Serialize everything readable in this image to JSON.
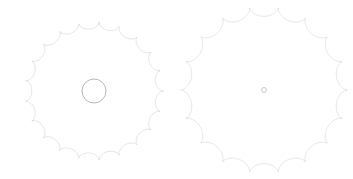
{
  "page": {
    "background_color": "#ffffff",
    "width": 353,
    "height": 179
  },
  "figures": [
    {
      "name": "left-spirograph",
      "label": "Left hypotrochoid rosette",
      "center_x": 94,
      "center_y": 91,
      "outer_radius": 69,
      "inner_hole_radius": 12,
      "petal_count": 21,
      "stroke_color": "#b9b9b9",
      "stroke_width": 0.45,
      "stroke_opacity": 0.85,
      "curve_type": "hypotrochoid",
      "R": 21,
      "r": 20,
      "d": 19.2,
      "turns": 20,
      "samples": 4200,
      "has_center_hole": true
    },
    {
      "name": "right-spirograph",
      "label": "Right hypotrochoid rosette",
      "center_x": 264,
      "center_y": 90,
      "outer_radius": 83,
      "inner_hole_radius": 2.5,
      "petal_count": 18,
      "stroke_color": "#bdbdbd",
      "stroke_width": 0.45,
      "stroke_opacity": 0.85,
      "curve_type": "hypotrochoid",
      "R": 18,
      "r": 17,
      "d": 16.8,
      "turns": 17,
      "samples": 4200,
      "has_center_hole": false
    }
  ],
  "chart_data": {
    "type": "line",
    "xlabel": "",
    "ylabel": "",
    "grid": false,
    "legend": "none",
    "series": [
      {
        "name": "left-rosette",
        "description": "21-petal hypotrochoid with hollow circular center",
        "petals": 21,
        "radius_outer_px": 69,
        "radius_inner_px": 12,
        "color": "#b9b9b9"
      },
      {
        "name": "right-rosette",
        "description": "18-petal hypotrochoid converging near a point",
        "petals": 18,
        "radius_outer_px": 83,
        "radius_inner_px": 2.5,
        "color": "#bdbdbd"
      }
    ]
  }
}
